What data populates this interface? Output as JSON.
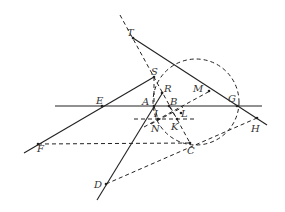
{
  "diagram": {
    "type": "geometry-construction",
    "colors": {
      "stroke": "#222222",
      "label": "#333333",
      "background": "#ffffff"
    },
    "circle": {
      "cx": 196,
      "cy": 102,
      "r": 43,
      "style": "dashed"
    },
    "points": [
      {
        "name": "T",
        "x": 133,
        "y": 38,
        "lx": 127,
        "ly": 36
      },
      {
        "name": "S",
        "x": 154,
        "y": 77,
        "lx": 151,
        "ly": 75
      },
      {
        "name": "R",
        "x": 162,
        "y": 93,
        "lx": 164,
        "ly": 92
      },
      {
        "name": "M",
        "x": 209,
        "y": 91,
        "lx": 193,
        "ly": 92
      },
      {
        "name": "E",
        "x": 102,
        "y": 106,
        "lx": 96,
        "ly": 104
      },
      {
        "name": "A",
        "x": 154,
        "y": 106,
        "lx": 142,
        "ly": 105
      },
      {
        "name": "B",
        "x": 169,
        "y": 106,
        "lx": 170,
        "ly": 105
      },
      {
        "name": "G",
        "x": 237,
        "y": 106,
        "lx": 228,
        "ly": 102
      },
      {
        "name": "I",
        "x": 158,
        "y": 119,
        "lx": 154,
        "ly": 117
      },
      {
        "name": "L",
        "x": 181,
        "y": 113,
        "lx": 181,
        "ly": 117
      },
      {
        "name": "N",
        "x": 158,
        "y": 119,
        "lx": 151,
        "ly": 132
      },
      {
        "name": "K",
        "x": 177,
        "y": 119,
        "lx": 171,
        "ly": 130
      },
      {
        "name": "H",
        "x": 257,
        "y": 118,
        "lx": 251,
        "ly": 132
      },
      {
        "name": "F",
        "x": 38,
        "y": 144,
        "lx": 37,
        "ly": 152
      },
      {
        "name": "C",
        "x": 190,
        "y": 143,
        "lx": 187,
        "ly": 154
      },
      {
        "name": "D",
        "x": 106,
        "y": 184,
        "lx": 94,
        "ly": 188
      }
    ],
    "solid_lines": [
      {
        "id": "line-EG",
        "x1": 55,
        "y1": 106,
        "x2": 262,
        "y2": 106
      },
      {
        "id": "line-TH",
        "x1": 133,
        "y1": 38,
        "x2": 267,
        "y2": 125
      },
      {
        "id": "line-FS",
        "x1": 24,
        "y1": 153,
        "x2": 154,
        "y2": 77
      },
      {
        "id": "line-DR",
        "x1": 97,
        "y1": 200,
        "x2": 163,
        "y2": 92
      }
    ],
    "dashed_lines": [
      {
        "id": "line-TC",
        "x1": 120,
        "y1": 15,
        "x2": 190,
        "y2": 143
      },
      {
        "id": "line-FC",
        "x1": 38,
        "y1": 144,
        "x2": 190,
        "y2": 143
      },
      {
        "id": "line-DH",
        "x1": 106,
        "y1": 184,
        "x2": 257,
        "y2": 118
      },
      {
        "id": "line-NK",
        "x1": 134,
        "y1": 119,
        "x2": 195,
        "y2": 119
      },
      {
        "id": "line-NM",
        "x1": 144,
        "y1": 127,
        "x2": 210,
        "y2": 91
      },
      {
        "id": "line-NL",
        "x1": 151,
        "y1": 124,
        "x2": 183,
        "y2": 107
      },
      {
        "id": "line-AN",
        "x1": 154,
        "y1": 106,
        "x2": 158,
        "y2": 119
      },
      {
        "id": "line-BK",
        "x1": 169,
        "y1": 106,
        "x2": 177,
        "y2": 119
      },
      {
        "id": "line-SA",
        "x1": 154,
        "y1": 77,
        "x2": 154,
        "y2": 106
      }
    ]
  }
}
